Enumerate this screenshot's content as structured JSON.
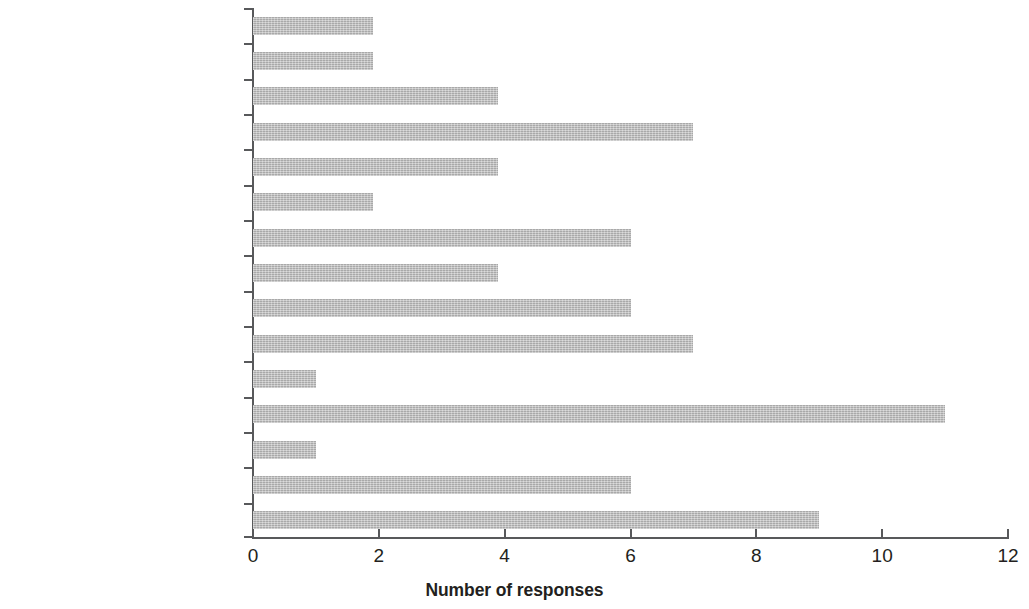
{
  "chart_data": {
    "type": "bar",
    "orientation": "horizontal",
    "title": "",
    "xlabel": "Number of responses",
    "ylabel": "",
    "xlim": [
      0,
      12
    ],
    "xticks": [
      0,
      2,
      4,
      6,
      8,
      10,
      12
    ],
    "grid": false,
    "legend": null,
    "bar_color": "#bdbdbd",
    "axis_color": "#58595b",
    "categories": [
      "Written communication",
      "People management",
      "Motivation",
      "Leadership",
      "Problem solving",
      "Oral communication",
      "Teamwork",
      "Work ethic",
      "Entrepreneurship",
      "Creativity",
      "Discipline specific theory",
      "Discipline specific training",
      "Time management",
      "Computer literacy",
      "English/French"
    ],
    "values": [
      1.9,
      1.9,
      3.9,
      7,
      3.9,
      1.9,
      6,
      3.9,
      6,
      7,
      1,
      11,
      1,
      6,
      9
    ]
  }
}
